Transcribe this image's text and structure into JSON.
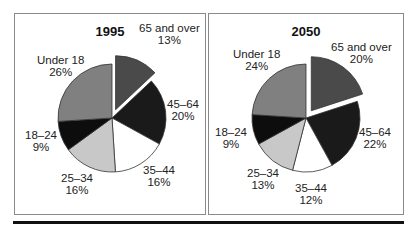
{
  "chart_data": [
    {
      "type": "pie",
      "title": "1995",
      "categories": [
        "65 and over",
        "45–64",
        "35–44",
        "25–34",
        "18–24",
        "Under 18"
      ],
      "values": [
        13,
        20,
        16,
        16,
        9,
        26
      ],
      "labels_pct": [
        "13%",
        "20%",
        "16%",
        "16%",
        "9%",
        "26%"
      ],
      "exploded": "65 and over",
      "colors": [
        "#4a4a4a",
        "#1a1a1a",
        "#ffffff",
        "#c8c8c8",
        "#0d0d0d",
        "#808080"
      ]
    },
    {
      "type": "pie",
      "title": "2050",
      "categories": [
        "65 and over",
        "45–64",
        "35–44",
        "25–34",
        "18–24",
        "Under 18"
      ],
      "values": [
        20,
        22,
        12,
        13,
        9,
        24
      ],
      "labels_pct": [
        "20%",
        "22%",
        "12%",
        "13%",
        "9%",
        "24%"
      ],
      "exploded": "65 and over",
      "colors": [
        "#4a4a4a",
        "#1a1a1a",
        "#ffffff",
        "#c8c8c8",
        "#0d0d0d",
        "#808080"
      ]
    }
  ]
}
